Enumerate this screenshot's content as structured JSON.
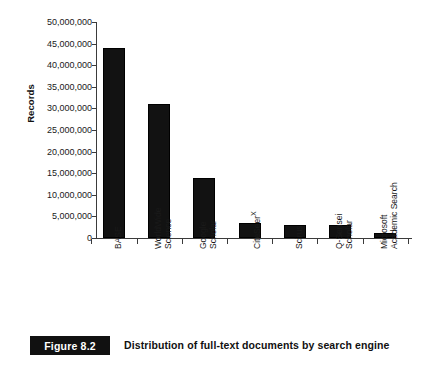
{
  "figure": {
    "number_label": "Figure 8.2",
    "caption": "Distribution of full-text documents by search engine"
  },
  "chart_data": {
    "type": "bar",
    "title": "",
    "xlabel": "",
    "ylabel": "Records",
    "ylim": [
      0,
      50000000
    ],
    "ytick_values": [
      0,
      5000000,
      10000000,
      15000000,
      20000000,
      25000000,
      30000000,
      35000000,
      40000000,
      45000000,
      50000000
    ],
    "ytick_labels": [
      "0",
      "5,000,000",
      "10,000,000",
      "15,000,000",
      "20,000,000",
      "25,000,000",
      "30,000,000",
      "35,000,000",
      "40,000,000",
      "45,000,000",
      "50,000,000"
    ],
    "grid": false,
    "legend": false,
    "bar_color": "#121212",
    "axis_color": "#3b3b3b",
    "categories": [
      "BASE",
      "WorldWide Science",
      "Google Scholar",
      "CiteSeerX",
      "Scirus",
      "Q-Sensei Scholar",
      "Microsoft Academic Search"
    ],
    "category_lines": [
      [
        "BASE"
      ],
      [
        "WorldWide",
        "Science"
      ],
      [
        "Google",
        "Scholar"
      ],
      [
        "CiteSeer",
        "X"
      ],
      [
        "Scirus"
      ],
      [
        "Q-Sensei",
        "Scholar"
      ],
      [
        "Microsoft",
        "Academic Search"
      ]
    ],
    "values": [
      44000000,
      31000000,
      13800000,
      3400000,
      2900000,
      3000000,
      1100000
    ]
  }
}
